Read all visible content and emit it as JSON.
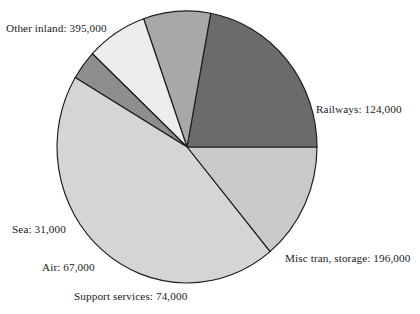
{
  "chart_data": {
    "type": "pie",
    "title": "",
    "subtitle": "",
    "xlabel": "",
    "ylabel": "",
    "legend_position": "none",
    "grid": false,
    "total": 887000,
    "units": "people",
    "categories": [
      "Railways",
      "Misc tran, storage",
      "Support services",
      "Air",
      "Sea",
      "Other inland"
    ],
    "values": [
      124000,
      196000,
      74000,
      67000,
      31000,
      395000
    ],
    "slices": [
      {
        "id": "railways",
        "label": "Railways",
        "value": 124000,
        "value_text": "124,000",
        "label_text": "Railways: 124,000",
        "color": "#c9c9c9",
        "start_angle": 309.7,
        "sweep": 50.3
      },
      {
        "id": "misc-tran-storage",
        "label": "Misc tran, storage",
        "value": 196000,
        "value_text": "196,000",
        "label_text": "Misc tran, storage: 196,000",
        "color": "#6b6b6b",
        "start_angle": 0.0,
        "sweep": 79.5
      },
      {
        "id": "support-services",
        "label": "Support services",
        "value": 74000,
        "value_text": "74,000",
        "label_text": "Support services: 74,000",
        "color": "#a8a8a8",
        "start_angle": 79.5,
        "sweep": 30.0
      },
      {
        "id": "air",
        "label": "Air",
        "value": 67000,
        "value_text": "67,000",
        "label_text": "Air: 67,000",
        "color": "#ededed",
        "start_angle": 109.5,
        "sweep": 27.2
      },
      {
        "id": "sea",
        "label": "Sea",
        "value": 31000,
        "value_text": "31,000",
        "label_text": "Sea: 31,000",
        "color": "#8e8e8e",
        "start_angle": 136.7,
        "sweep": 12.6
      },
      {
        "id": "other-inland",
        "label": "Other inland",
        "value": 395000,
        "value_text": "395,000",
        "label_text": "Other inland: 395,000",
        "color": "#d5d5d5",
        "start_angle": 149.3,
        "sweep": 160.4
      }
    ],
    "geometry": {
      "center_x": 187,
      "center_y": 147,
      "radius_x": 130,
      "radius_y": 136
    },
    "outline_color": "#1b1b1b",
    "background": "#ffffff"
  }
}
